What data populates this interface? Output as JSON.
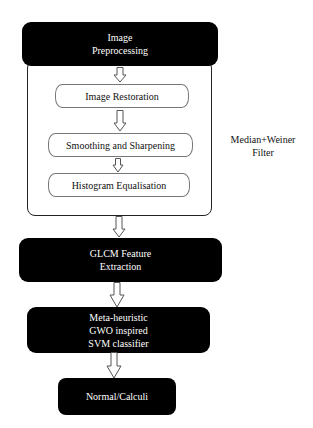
{
  "diagram": {
    "type": "flowchart",
    "colors": {
      "box_fill": "#000000",
      "box_text": "#ffffff",
      "sub_box_border": "#777777",
      "container_border": "#222222",
      "arrow_stroke": "#555555"
    },
    "nodes": {
      "preprocessing": {
        "lines": [
          "Image",
          "Preprocessing"
        ]
      },
      "restoration": {
        "label": "Image Restoration"
      },
      "smoothing": {
        "label": "Smoothing and Sharpening"
      },
      "histogram": {
        "label": "Histogram Equalisation"
      },
      "glcm": {
        "lines": [
          "GLCM Feature",
          "Extraction"
        ]
      },
      "classifier": {
        "lines": [
          "Meta-heuristic",
          "GWO inspired",
          "SVM classifier"
        ]
      },
      "output": {
        "label": "Normal/Calculi"
      }
    },
    "side_note": {
      "lines": [
        "Median+Weiner",
        "Filter"
      ]
    },
    "edges": [
      {
        "from": "preprocessing",
        "to": "restoration",
        "style": "hollow-arrow"
      },
      {
        "from": "restoration",
        "to": "smoothing",
        "style": "hollow-arrow"
      },
      {
        "from": "smoothing",
        "to": "histogram",
        "style": "hollow-arrow"
      },
      {
        "from": "preprocessing-group",
        "to": "glcm",
        "style": "hollow-arrow"
      },
      {
        "from": "glcm",
        "to": "classifier",
        "style": "hollow-arrow"
      },
      {
        "from": "classifier",
        "to": "output",
        "style": "hollow-arrow"
      }
    ]
  }
}
